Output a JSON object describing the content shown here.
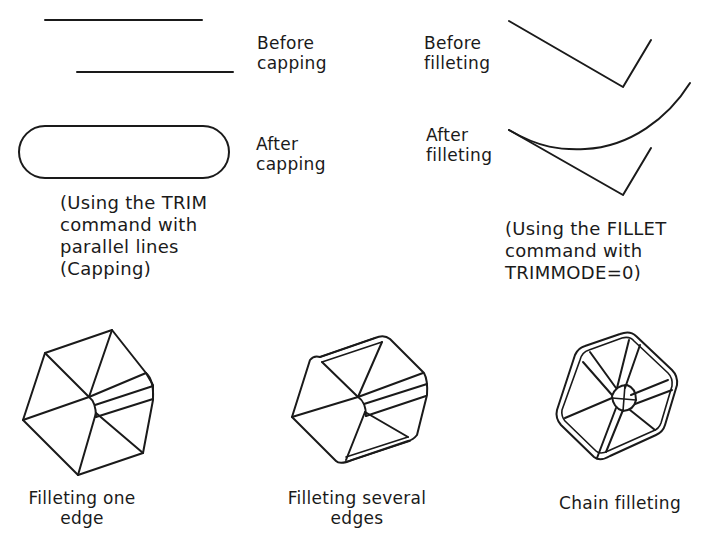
{
  "capping": {
    "before_label": [
      "Before",
      "capping"
    ],
    "after_label": [
      "After",
      "capping"
    ],
    "note": [
      "(Using the TRIM",
      "command with",
      "parallel lines",
      "(Capping)"
    ]
  },
  "filleting": {
    "before_label": [
      "Before",
      "filleting"
    ],
    "after_label": [
      "After",
      "filleting"
    ],
    "note": [
      "(Using the FILLET",
      "command with",
      "TRIMMODE=0)"
    ]
  },
  "solids": [
    {
      "caption": [
        "Filleting one",
        "edge"
      ]
    },
    {
      "caption": [
        "Filleting several",
        "edges"
      ]
    },
    {
      "caption": [
        "Chain filleting"
      ]
    }
  ]
}
